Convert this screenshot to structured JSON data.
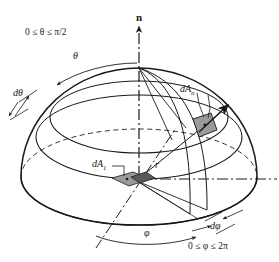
{
  "figure": {
    "type": "hemisphere-solid-angle-diagram",
    "background_color": "#ffffff",
    "line_color": "#1a1a1a",
    "patch_fill_color": "#9a9a9a",
    "patch_dark_color": "#4a4a4a"
  },
  "labels": {
    "normal_axis": "n",
    "theta": "θ",
    "d_theta": "dθ",
    "theta_range_prefix": "0 ≤ ",
    "theta_range_symbol": "θ",
    "theta_range_suffix": " ≤ π/2",
    "theta_range_full": "0 ≤ θ ≤ π/2",
    "phi": "φ",
    "d_phi": "dφ",
    "phi_range_prefix": "0 ≤ ",
    "phi_range_symbol": "φ",
    "phi_range_suffix": " ≤ 2π",
    "phi_range_full": "0 ≤ φ ≤ 2π",
    "radius": "r",
    "area_normal": "dA",
    "area_normal_sub": "n",
    "area_base": "dA",
    "area_base_sub": "1"
  },
  "geometry": {
    "center": {
      "x": 139,
      "y": 177
    },
    "apex": {
      "x": 139,
      "y": 68
    },
    "radius_x": 118,
    "radius_y": 48,
    "sphere_radius_y": 109,
    "patch_normal_center": {
      "x": 205,
      "y": 126
    },
    "patch_base_center": {
      "x": 135,
      "y": 180
    }
  }
}
